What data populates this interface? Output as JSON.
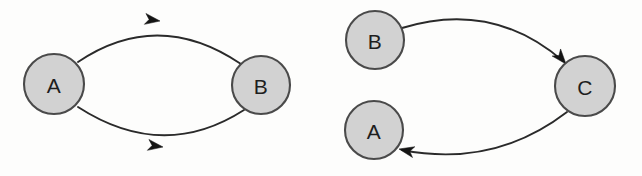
{
  "figure": {
    "background_color": "#fdfdfc",
    "width": 642,
    "height": 176
  },
  "style": {
    "node_fill": "#d2d2d2",
    "node_stroke": "#4a4a4a",
    "edge_color": "#2a2a2a",
    "label_color": "#1e1e1e",
    "arrow_fill": "#141414"
  },
  "diagrams": [
    {
      "name": "two-node-cycle",
      "nodes": [
        {
          "id": "A",
          "label": "A",
          "cx": 54,
          "cy": 84,
          "r": 30
        },
        {
          "id": "B",
          "label": "B",
          "cx": 261,
          "cy": 85,
          "r": 29
        }
      ],
      "edges": [
        {
          "name": "edge-b-to-a",
          "from": "B",
          "to": "A",
          "label": "",
          "path": "M 241 64 Q 158 8 78 62",
          "arrow": {
            "x": 160,
            "y": 21,
            "angle": 188
          }
        },
        {
          "name": "edge-a-to-b",
          "from": "A",
          "to": "B",
          "label": "",
          "path": "M 78 107 Q 163 162 244 110",
          "arrow": {
            "x": 163,
            "y": 147,
            "angle": 8
          }
        }
      ]
    },
    {
      "name": "three-node-chain",
      "nodes": [
        {
          "id": "B",
          "label": "B",
          "cx": 375,
          "cy": 40,
          "r": 29
        },
        {
          "id": "A",
          "label": "A",
          "cx": 374,
          "cy": 130,
          "r": 29
        },
        {
          "id": "C",
          "label": "C",
          "cx": 585,
          "cy": 86,
          "r": 30
        }
      ],
      "edges": [
        {
          "name": "edge-b-to-c",
          "from": "B",
          "to": "C",
          "label": "",
          "path": "M 402 28 Q 492 0 563 61",
          "arrow": {
            "x": 565,
            "y": 63,
            "angle": 50
          }
        },
        {
          "name": "edge-c-to-a",
          "from": "C",
          "to": "A",
          "label": "",
          "path": "M 567 112 Q 494 168 402 150",
          "arrow": {
            "x": 399,
            "y": 149,
            "angle": 192
          }
        }
      ]
    }
  ]
}
